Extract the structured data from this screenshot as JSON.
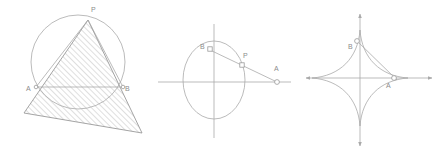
{
  "figure": {
    "background_color": "#ffffff",
    "stroke_color": "#a9a9a9",
    "label_color": "#8d8d8d",
    "panels": [
      {
        "name": "inscribed-triangle-in-circle",
        "description": "Hatched triangle with vertex P on a circle and chord endpoints A and B",
        "labels": [
          {
            "text": "P",
            "x": 91,
            "y": 12
          },
          {
            "text": "A",
            "x": 28,
            "y": 91
          },
          {
            "text": "B",
            "x": 124,
            "y": 91
          }
        ],
        "circle": {
          "cx": 78,
          "cy": 62,
          "r": 47
        },
        "triangle_points": "88,20 24,113 142,133",
        "markers": [
          {
            "name": "point-A",
            "shape": "dot",
            "x": 36,
            "y": 87
          },
          {
            "name": "point-B",
            "shape": "dot",
            "x": 123,
            "y": 87
          }
        ]
      },
      {
        "name": "ellipse-with-secant",
        "description": "Ellipse with x and y axes, points B and P on curve and A on the x-axis",
        "labels": [
          {
            "text": "B",
            "x": 203,
            "y": 48
          },
          {
            "text": "P",
            "x": 246,
            "y": 57
          },
          {
            "text": "A",
            "x": 273,
            "y": 70
          }
        ],
        "ellipse": {
          "cx": 214,
          "cy": 80,
          "rx": 31,
          "ry": 39
        },
        "x_axis": {
          "x1": 158,
          "y1": 82,
          "x2": 291,
          "y2": 82
        },
        "y_axis": {
          "x1": 214,
          "y1": 24,
          "x2": 214,
          "y2": 138
        },
        "segment": {
          "x1": 210,
          "y1": 50,
          "x2": 277,
          "y2": 82
        },
        "markers": [
          {
            "name": "point-B",
            "shape": "square",
            "x": 211,
            "y": 50
          },
          {
            "name": "point-P",
            "shape": "square",
            "x": 242,
            "y": 65
          },
          {
            "name": "point-A",
            "shape": "dot",
            "x": 277,
            "y": 82
          }
        ]
      },
      {
        "name": "astroid-with-tangent",
        "description": "Astroid (four-cusped hypocycloid) with axes and tangent segment through B and A",
        "labels": [
          {
            "text": "B",
            "x": 349,
            "y": 47
          },
          {
            "text": "A",
            "x": 387,
            "y": 87
          }
        ],
        "astroid": {
          "cx": 360,
          "cy": 78,
          "a": 48
        },
        "x_axis": {
          "x1": 302,
          "y1": 78,
          "x2": 436,
          "y2": 78
        },
        "y_axis": {
          "x1": 360,
          "y1": 10,
          "x2": 360,
          "y2": 150
        },
        "segment": {
          "x1": 356,
          "y1": 40,
          "x2": 397,
          "y2": 80
        },
        "markers": [
          {
            "name": "point-B",
            "shape": "dot",
            "x": 357,
            "y": 41
          },
          {
            "name": "point-A",
            "shape": "dot",
            "x": 394,
            "y": 78
          }
        ]
      }
    ]
  }
}
